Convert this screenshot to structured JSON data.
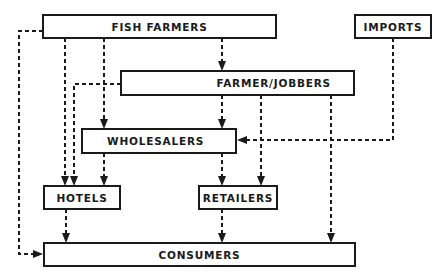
{
  "diagram": {
    "type": "flow-chart",
    "nodes": {
      "fish_farmers": {
        "label": "FISH FARMERS"
      },
      "imports": {
        "label": "IMPORTS"
      },
      "farmer_jobbers": {
        "label": "FARMER/JOBBERS"
      },
      "wholesalers": {
        "label": "WHOLESALERS"
      },
      "hotels": {
        "label": "HOTELS"
      },
      "retailers": {
        "label": "RETAILERS"
      },
      "consumers": {
        "label": "CONSUMERS"
      }
    },
    "edges": [
      {
        "from": "FISH FARMERS",
        "to": "FARMER/JOBBERS"
      },
      {
        "from": "FISH FARMERS",
        "to": "WHOLESALERS"
      },
      {
        "from": "FISH FARMERS",
        "to": "HOTELS"
      },
      {
        "from": "FISH FARMERS",
        "to": "CONSUMERS"
      },
      {
        "from": "FARMER/JOBBERS",
        "to": "HOTELS"
      },
      {
        "from": "FARMER/JOBBERS",
        "to": "WHOLESALERS"
      },
      {
        "from": "FARMER/JOBBERS",
        "to": "RETAILERS"
      },
      {
        "from": "FARMER/JOBBERS",
        "to": "CONSUMERS"
      },
      {
        "from": "IMPORTS",
        "to": "WHOLESALERS"
      },
      {
        "from": "WHOLESALERS",
        "to": "HOTELS"
      },
      {
        "from": "WHOLESALERS",
        "to": "RETAILERS"
      },
      {
        "from": "HOTELS",
        "to": "CONSUMERS"
      },
      {
        "from": "RETAILERS",
        "to": "CONSUMERS"
      }
    ],
    "line_style": "dashed",
    "line_color": "#1a1a1a"
  }
}
